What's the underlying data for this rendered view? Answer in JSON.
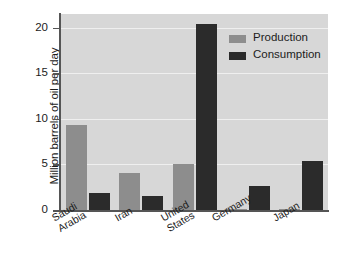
{
  "chart_data": {
    "type": "bar",
    "title": "",
    "xlabel": "",
    "ylabel": "Million barrels of oil per day",
    "categories": [
      "Saudi Arabia",
      "Iran",
      "United States",
      "Germany",
      "Japan"
    ],
    "category_lines": [
      [
        "Saudi",
        "Arabia"
      ],
      [
        "Iran"
      ],
      [
        "United",
        "States"
      ],
      [
        "Germany"
      ],
      [
        "Japan"
      ]
    ],
    "series": [
      {
        "name": "Production",
        "color": "#8d8d8d",
        "values": [
          9.3,
          4.1,
          5.1,
          0.1,
          0.1
        ]
      },
      {
        "name": "Consumption",
        "color": "#2b2b2b",
        "values": [
          1.9,
          1.5,
          20.4,
          2.6,
          5.4
        ]
      }
    ],
    "ylim": [
      0,
      21.5
    ],
    "yticks": [
      20,
      15,
      10,
      5,
      0
    ],
    "ytick_labels": [
      "20",
      "15",
      "10",
      "5",
      "0"
    ],
    "grid": true,
    "legend_position": "top-right",
    "plot_background": "#d7d7d7",
    "gridline_color": "#efefef",
    "axis_color": "#555555"
  },
  "legend": {
    "entries": [
      {
        "label": "Production"
      },
      {
        "label": "Consumption"
      }
    ]
  }
}
